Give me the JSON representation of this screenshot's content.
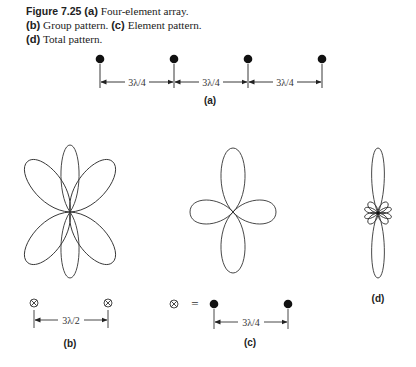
{
  "caption": {
    "figure_label": "Figure 7.25",
    "part_a_tag": "(a)",
    "part_a_text": "Four-element array.",
    "part_b_tag": "(b)",
    "part_b_text": "Group pattern.",
    "part_c_tag": "(c)",
    "part_c_text": "Element pattern.",
    "part_d_tag": "(d)",
    "part_d_text": "Total pattern."
  },
  "panel_a": {
    "label": "(a)",
    "element_count": 4,
    "spacings": [
      "3λ/4",
      "3λ/4",
      "3λ/4"
    ]
  },
  "panel_b": {
    "label": "(b)",
    "spacing": "3λ/2",
    "element_symbol": "⊗"
  },
  "panel_c": {
    "label": "(c)",
    "equation_symbol": "⊗",
    "equals": "=",
    "spacing": "3λ/4"
  },
  "panel_d": {
    "label": "(d)"
  },
  "colors": {
    "ink": "#222222",
    "background": "#ffffff"
  }
}
